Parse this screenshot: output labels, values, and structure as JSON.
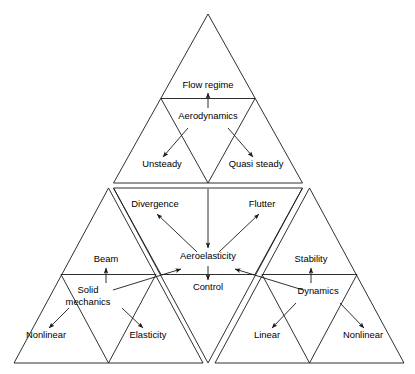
{
  "diagram": {
    "type": "hierarchical-triangle-diagram",
    "stroke_color": "#1a1a1a",
    "background_color": "#ffffff",
    "labels": {
      "flow_regime": "Flow regime",
      "aerodynamics": "Aerodynamics",
      "unsteady": "Unsteady",
      "quasi_steady": "Quasi steady",
      "divergence": "Divergence",
      "flutter": "Flutter",
      "aeroelasticity": "Aeroelasticity",
      "control": "Control",
      "beam": "Beam",
      "solid_mechanics_line1": "Solid",
      "solid_mechanics_line2": "mechanics",
      "nonlinear_left": "Nonlinear",
      "elasticity": "Elasticity",
      "stability": "Stability",
      "dynamics": "Dynamics",
      "linear": "Linear",
      "nonlinear_right": "Nonlinear"
    },
    "nodes": [
      {
        "id": "flow-regime",
        "label": "Flow regime",
        "x": 208,
        "y": 86,
        "group": "aerodynamics-triangle"
      },
      {
        "id": "aerodynamics",
        "label": "Aerodynamics",
        "x": 208,
        "y": 117,
        "group": "aerodynamics-triangle"
      },
      {
        "id": "unsteady",
        "label": "Unsteady",
        "x": 162,
        "y": 165,
        "group": "aerodynamics-triangle"
      },
      {
        "id": "quasi-steady",
        "label": "Quasi steady",
        "x": 256,
        "y": 165,
        "group": "aerodynamics-triangle"
      },
      {
        "id": "divergence",
        "label": "Divergence",
        "x": 155,
        "y": 205,
        "group": "aeroelasticity-triangle"
      },
      {
        "id": "flutter",
        "label": "Flutter",
        "x": 262,
        "y": 205,
        "group": "aeroelasticity-triangle"
      },
      {
        "id": "aeroelasticity",
        "label": "Aeroelasticity",
        "x": 208,
        "y": 257,
        "group": "aeroelasticity-triangle"
      },
      {
        "id": "control",
        "label": "Control",
        "x": 208,
        "y": 288,
        "group": "aeroelasticity-triangle"
      },
      {
        "id": "beam",
        "label": "Beam",
        "x": 106,
        "y": 260,
        "group": "solid-mechanics-triangle"
      },
      {
        "id": "solid-mechanics",
        "label": "Solid mechanics",
        "x": 88,
        "y": 292,
        "group": "solid-mechanics-triangle"
      },
      {
        "id": "nonlinear-left",
        "label": "Nonlinear",
        "x": 46,
        "y": 336,
        "group": "solid-mechanics-triangle"
      },
      {
        "id": "elasticity",
        "label": "Elasticity",
        "x": 148,
        "y": 336,
        "group": "solid-mechanics-triangle"
      },
      {
        "id": "stability",
        "label": "Stability",
        "x": 311,
        "y": 260,
        "group": "dynamics-triangle"
      },
      {
        "id": "dynamics",
        "label": "Dynamics",
        "x": 318,
        "y": 292,
        "group": "dynamics-triangle"
      },
      {
        "id": "linear",
        "label": "Linear",
        "x": 267,
        "y": 336,
        "group": "dynamics-triangle"
      },
      {
        "id": "nonlinear-right",
        "label": "Nonlinear",
        "x": 363,
        "y": 336,
        "group": "dynamics-triangle"
      }
    ],
    "edges": [
      {
        "from": "aerodynamics",
        "to": "flow-regime"
      },
      {
        "from": "aerodynamics",
        "to": "unsteady"
      },
      {
        "from": "aerodynamics",
        "to": "quasi-steady"
      },
      {
        "from": "aeroelasticity",
        "to": "divergence"
      },
      {
        "from": "aeroelasticity",
        "to": "flutter"
      },
      {
        "from": "aerodynamics",
        "to": "aeroelasticity"
      },
      {
        "from": "aeroelasticity",
        "to": "control"
      },
      {
        "from": "solid-mechanics",
        "to": "beam"
      },
      {
        "from": "solid-mechanics",
        "to": "nonlinear-left"
      },
      {
        "from": "solid-mechanics",
        "to": "elasticity"
      },
      {
        "from": "solid-mechanics",
        "to": "aeroelasticity"
      },
      {
        "from": "dynamics",
        "to": "stability"
      },
      {
        "from": "dynamics",
        "to": "linear"
      },
      {
        "from": "dynamics",
        "to": "nonlinear-right"
      },
      {
        "from": "dynamics",
        "to": "aeroelasticity"
      }
    ]
  }
}
